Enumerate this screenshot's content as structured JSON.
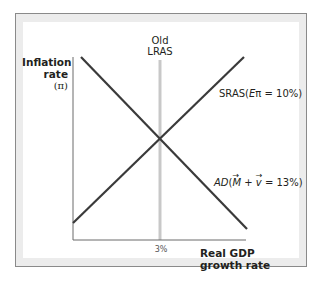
{
  "diagram": {
    "type": "AD-AS macro diagram",
    "y_axis": {
      "label_line1": "Inflation",
      "label_line2": "rate",
      "label_line3": "(π)"
    },
    "x_axis": {
      "label_line1": "Real GDP",
      "label_line2": "growth rate",
      "tick": "3%"
    },
    "curves": {
      "lras": {
        "label_line1": "Old",
        "label_line2": "LRAS",
        "color": "#c8c8c8"
      },
      "sras": {
        "prefix": "SRAS(",
        "italic": "E",
        "symbol": "π",
        "suffix": " = 10%)",
        "color": "#3a3a3a"
      },
      "ad": {
        "prefix": "AD",
        "open": "(",
        "m": "M",
        "plus": " + ",
        "v": "v",
        "suffix": " = 13%)",
        "color": "#3a3a3a"
      }
    },
    "colors": {
      "axis": "#6b6b6b",
      "panel_border": "#8a8a8a",
      "panel_frame": "#ececec"
    }
  }
}
